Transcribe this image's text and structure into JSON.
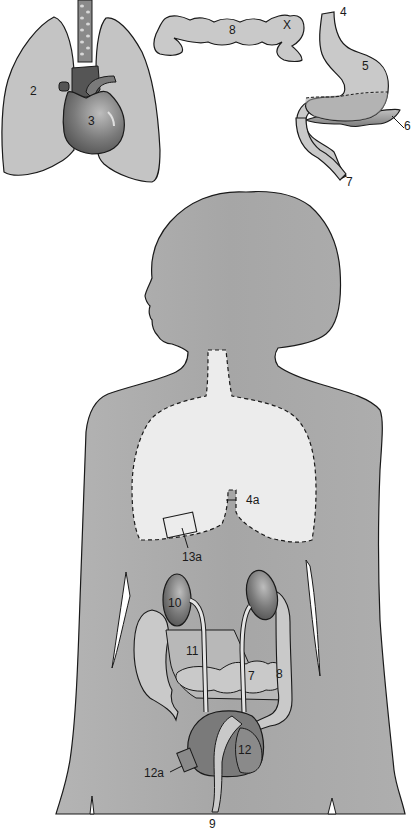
{
  "diagram": {
    "type": "anatomical-illustration",
    "colors": {
      "background": "#ffffff",
      "body_fill": "#a9a9a9",
      "organ_fill": "#c9c9c9",
      "lung_region_fill": "#ececec",
      "dark_organ_fill": "#6f6f6f",
      "outline": "#1a1a1a"
    },
    "insets": {
      "thorax": {
        "labels": {
          "lung": "2",
          "heart": "3"
        }
      },
      "colon": {
        "labels": {
          "transverse_colon": "8",
          "mark": "X"
        }
      },
      "stomach": {
        "labels": {
          "esophagus": "4",
          "stomach": "5",
          "pancreas": "6",
          "duodenum": "7"
        }
      }
    },
    "body": {
      "labels": {
        "esophagus_marker": "4a",
        "chest_box_marker": "13a",
        "kidney": "10",
        "small_intestine": "11",
        "jejunum_mark": "7",
        "colon": "8",
        "bladder": "12",
        "bladder_box_marker": "12a",
        "rectum_exit": "9"
      }
    }
  }
}
